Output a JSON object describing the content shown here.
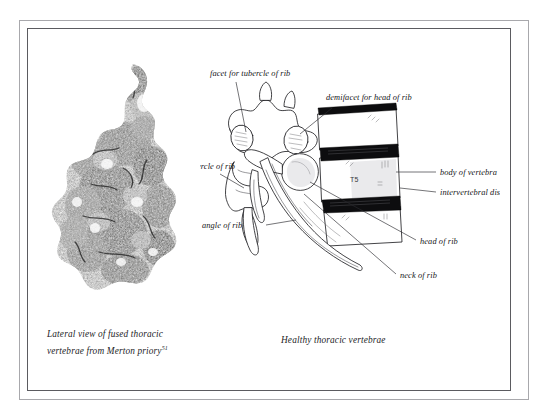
{
  "figure": {
    "left": {
      "caption_line1": "Lateral view of fused thoracic",
      "caption_line2": "vertebrae from Merton priory",
      "caption_footnote": "51",
      "image_alt": "photograph-of-fused-thoracic-vertebrae"
    },
    "right": {
      "caption": "Healthy thoracic vertebrae",
      "vertebra_level_label": "T5",
      "labels": [
        {
          "id": "facet-for-tubercle-of-rib",
          "text": "facet for tubercle of rib"
        },
        {
          "id": "demifacet-for-head-of-rib",
          "text": "demifacet for head of rib"
        },
        {
          "id": "tubercle-of-rib",
          "text": "tubercle of rib"
        },
        {
          "id": "body-of-vertebra",
          "text": "body of vertebra"
        },
        {
          "id": "intervertebral-disc",
          "text": "intervertebral disc"
        },
        {
          "id": "angle-of-rib",
          "text": "angle of rib"
        },
        {
          "id": "head-of-rib",
          "text": "head of rib"
        },
        {
          "id": "neck-of-rib",
          "text": "neck of rib"
        }
      ]
    }
  },
  "colors": {
    "page_background": "#ffffff",
    "frame_outer": "#a8a8ac",
    "frame_inner": "#5b5b60",
    "ink": "#1d1d1f",
    "disc_dark": "#0d0d0f"
  }
}
